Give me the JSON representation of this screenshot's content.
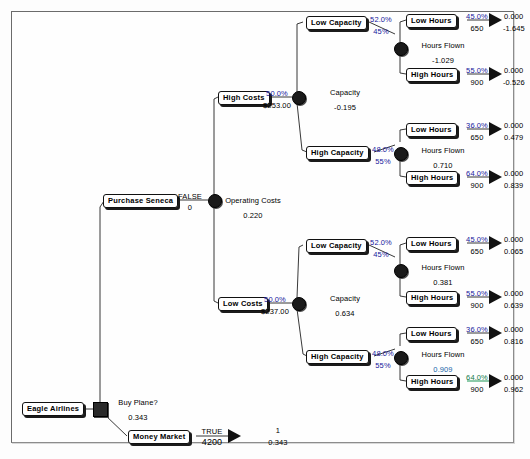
{
  "diagram": {
    "colors": {
      "probability": "#17179c",
      "highlight_green": "#0f7a46",
      "highlight_blue": "#1565a8",
      "node_fill": "#1a1a1a",
      "line": "#222222"
    }
  },
  "root": {
    "label": "Eagle Airlines",
    "node_type": "decision"
  },
  "branches": {
    "buy_plane": {
      "question_label": "Buy Plane?",
      "question_value": "0.343",
      "decision_label": "Purchase Seneca",
      "decision_flag": "FALSE",
      "decision_payoff": "0",
      "chance_label": "Operating Costs",
      "chance_value": "0.220"
    },
    "money_market": {
      "label": "Money Market",
      "flag": "TRUE",
      "payoff": "4200",
      "endpoint_top": "1",
      "endpoint_bottom": "0.343"
    }
  },
  "cost_nodes": [
    {
      "label": "High Costs",
      "probability": "50.0%",
      "payoff": "$253.00",
      "chance_label": "Capacity",
      "chance_value": "-0.195"
    },
    {
      "label": "Low Costs",
      "probability": "50.0%",
      "payoff": "$237.00",
      "chance_label": "Capacity",
      "chance_value": "0.634"
    }
  ],
  "capacity_nodes": [
    {
      "label": "Low Capacity",
      "probability": "52.0%",
      "payoff": "45%",
      "chance_label": "Hours Flown",
      "chance_value": "-1.029",
      "chance_value_style": "plain"
    },
    {
      "label": "High Capacity",
      "probability": "48.0%",
      "payoff": "55%",
      "chance_label": "Hours Flown",
      "chance_value": "0.710",
      "chance_value_style": "plain"
    },
    {
      "label": "Low Capacity",
      "probability": "52.0%",
      "payoff": "45%",
      "chance_label": "Hours Flown",
      "chance_value": "0.381",
      "chance_value_style": "plain"
    },
    {
      "label": "High Capacity",
      "probability": "48.0%",
      "payoff": "55%",
      "chance_label": "Hours Flown",
      "chance_value": "0.909",
      "chance_value_style": "teal"
    }
  ],
  "hours_nodes": [
    {
      "label": "Low Hours",
      "probability": "45.0%",
      "payoff": "650",
      "end_top": "0.000",
      "end_bottom": "-1.645",
      "highlight": "none"
    },
    {
      "label": "High Hours",
      "probability": "55.0%",
      "payoff": "900",
      "end_top": "0.000",
      "end_bottom": "-0.526",
      "highlight": "none"
    },
    {
      "label": "Low Hours",
      "probability": "36.0%",
      "payoff": "650",
      "end_top": "0.000",
      "end_bottom": "0.479",
      "highlight": "none"
    },
    {
      "label": "High Hours",
      "probability": "64.0%",
      "payoff": "900",
      "end_top": "0.000",
      "end_bottom": "0.839",
      "highlight": "none"
    },
    {
      "label": "Low Hours",
      "probability": "45.0%",
      "payoff": "650",
      "end_top": "0.000",
      "end_bottom": "0.065",
      "highlight": "none"
    },
    {
      "label": "High Hours",
      "probability": "55.0%",
      "payoff": "900",
      "end_top": "0.000",
      "end_bottom": "0.639",
      "highlight": "none"
    },
    {
      "label": "Low Hours",
      "probability": "36.0%",
      "payoff": "650",
      "end_top": "0.000",
      "end_bottom": "0.816",
      "highlight": "none"
    },
    {
      "label": "High Hours",
      "probability": "64.0%",
      "payoff": "900",
      "end_top": "0.000",
      "end_bottom": "0.962",
      "highlight": "green"
    }
  ]
}
